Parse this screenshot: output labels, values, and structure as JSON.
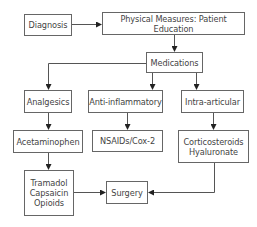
{
  "diagram": {
    "type": "flowchart",
    "nodes": [
      {
        "id": "diagnosis",
        "label": "Diagnosis"
      },
      {
        "id": "physical",
        "label": "Physical Measures: Patient Education"
      },
      {
        "id": "medications",
        "label": "Medications"
      },
      {
        "id": "analgesics",
        "label": "Analgesics"
      },
      {
        "id": "antiinflammatory",
        "label": "Anti-inflammatory"
      },
      {
        "id": "intraarticular",
        "label": "Intra-articular"
      },
      {
        "id": "acetaminophen",
        "label": "Acetaminophen"
      },
      {
        "id": "nsaids",
        "label": "NSAIDs/Cox-2"
      },
      {
        "id": "corticosteroids",
        "label": "Corticosteroids\nHyaluronate"
      },
      {
        "id": "tramadol",
        "label": "Tramadol\nCapsaicin\nOpioids"
      },
      {
        "id": "surgery",
        "label": "Surgery"
      }
    ],
    "edges": [
      {
        "from": "diagnosis",
        "to": "physical"
      },
      {
        "from": "physical",
        "to": "medications"
      },
      {
        "from": "medications",
        "to": "analgesics"
      },
      {
        "from": "medications",
        "to": "antiinflammatory"
      },
      {
        "from": "medications",
        "to": "intraarticular"
      },
      {
        "from": "analgesics",
        "to": "acetaminophen"
      },
      {
        "from": "antiinflammatory",
        "to": "nsaids"
      },
      {
        "from": "intraarticular",
        "to": "corticosteroids"
      },
      {
        "from": "acetaminophen",
        "to": "tramadol"
      },
      {
        "from": "tramadol",
        "to": "surgery"
      },
      {
        "from": "corticosteroids",
        "to": "surgery"
      }
    ]
  }
}
